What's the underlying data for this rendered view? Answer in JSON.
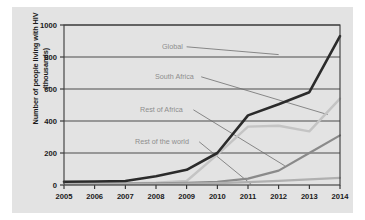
{
  "chart_data": {
    "type": "line",
    "title": "",
    "xlabel": "",
    "ylabel": "Number of people living with HIV (thousands)",
    "ylabel_line1": "Number of people living with HIV",
    "ylabel_line2": "(thousands)",
    "x": [
      2005,
      2006,
      2007,
      2008,
      2009,
      2010,
      2011,
      2012,
      2013,
      2014
    ],
    "xtick_labels": [
      "2005",
      "2006",
      "2007",
      "2008",
      "2009",
      "2010",
      "2011",
      "2012",
      "2013",
      "2014"
    ],
    "ytick_labels": [
      "0",
      "200",
      "400",
      "600",
      "800",
      "1000"
    ],
    "yticks": [
      0,
      200,
      400,
      600,
      800,
      1000
    ],
    "ylim": [
      0,
      1000
    ],
    "xlim": [
      2005,
      2014
    ],
    "grid": "horizontal",
    "legend_position": "inline-annotations",
    "series": [
      {
        "name": "Global",
        "color": "#2b2b2b",
        "width": 2.6,
        "label": "Global",
        "values": [
          20,
          22,
          25,
          55,
          95,
          200,
          435,
          505,
          580,
          930
        ]
      },
      {
        "name": "South Africa",
        "color": "#c4c4c4",
        "width": 2.4,
        "label": "South Africa",
        "values": [
          8,
          9,
          10,
          14,
          25,
          190,
          365,
          370,
          335,
          540
        ]
      },
      {
        "name": "Rest of Africa",
        "color": "#8a8a8a",
        "width": 2.2,
        "label": "Rest of Africa",
        "values": [
          6,
          7,
          8,
          10,
          14,
          20,
          40,
          90,
          200,
          310
        ]
      },
      {
        "name": "Rest of the world",
        "color": "#b0b0b0",
        "width": 2.2,
        "label": "Rest of the world",
        "values": [
          5,
          5,
          6,
          7,
          9,
          12,
          18,
          26,
          35,
          45
        ]
      }
    ],
    "annotations": [
      {
        "text": "Global",
        "x": 150,
        "y": 42
      },
      {
        "text": "South Africa",
        "x": 143,
        "y": 72
      },
      {
        "text": "Rest of Africa",
        "x": 128,
        "y": 105
      },
      {
        "text": "Rest of the world",
        "x": 123,
        "y": 137
      }
    ]
  }
}
